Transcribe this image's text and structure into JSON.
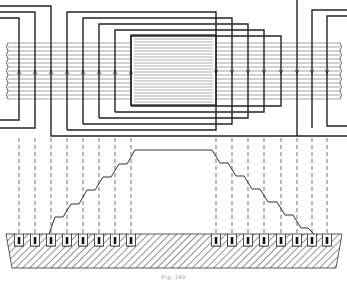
{
  "figure": {
    "caption": "Fig. 160",
    "colors": {
      "ink": "#222222",
      "paper": "#ffffff",
      "hatch": "#555555"
    }
  },
  "diagram": {
    "lamination_band": {
      "top": 43,
      "bottom": 99,
      "left": 6,
      "right": 340
    },
    "core_block": {
      "left": 131,
      "right": 216,
      "top": 35,
      "bottom": 105
    },
    "left_slots_x": [
      19,
      35,
      51,
      67,
      83,
      99,
      115,
      131
    ],
    "right_slots_x": [
      216,
      232,
      248,
      264,
      281,
      297,
      312,
      327
    ],
    "mmf_levels_y": [
      230,
      217,
      204,
      190,
      177,
      164,
      150,
      137,
      124
    ],
    "surface_y": 234
  }
}
